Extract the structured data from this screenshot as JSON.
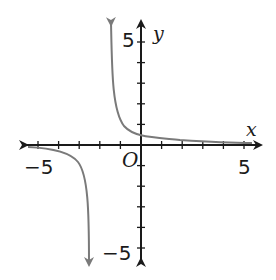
{
  "chart_data": {
    "type": "line",
    "title": "",
    "xlabel": "x",
    "ylabel": "y",
    "origin_label": "O",
    "xlim": [
      -5,
      5
    ],
    "ylim": [
      -5,
      5
    ],
    "x_tick_labels": [
      "-5",
      "5"
    ],
    "y_tick_labels": [
      "5",
      "-5"
    ],
    "tick_step": 1,
    "grid": false,
    "legend": null,
    "series": [
      {
        "name": "curve",
        "description": "Rational function with vertical asymptote near x = -2 and horizontal asymptote y = 0",
        "color": "#7a7a7a",
        "branches": [
          {
            "x": [
              -1.45,
              -1.4,
              -1.3,
              -1.2,
              -1.0,
              -0.5,
              0,
              1,
              2,
              3,
              4,
              5
            ],
            "y": [
              6.0,
              4.0,
              2.6,
              1.8,
              1.1,
              0.75,
              0.55,
              0.33,
              0.22,
              0.15,
              0.1,
              0.05
            ]
          },
          {
            "x": [
              -5,
              -4.5,
              -4,
              -3.5,
              -3,
              -2.7,
              -2.55,
              -2.5
            ],
            "y": [
              -0.05,
              -0.3,
              -0.6,
              -1.1,
              -2.0,
              -3.2,
              -4.5,
              -5.8
            ]
          }
        ]
      }
    ]
  },
  "labels": {
    "x_axis": "x",
    "y_axis": "y",
    "origin": "O",
    "x_min": "−5",
    "x_max": "5",
    "y_max": "5",
    "y_min": "−5"
  }
}
